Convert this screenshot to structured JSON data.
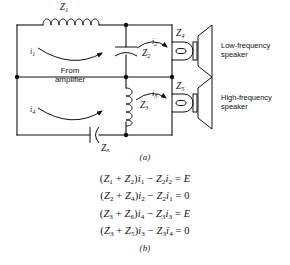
{
  "figure": {
    "panel_a_label": "(a)",
    "panel_b_label": "(b)",
    "source_text_line1": "From",
    "source_text_line2": "amplifier",
    "speaker_low_line1": "Low-frequency",
    "speaker_low_line2": "speaker",
    "speaker_high_line1": "High-frequency",
    "speaker_high_line2": "speaker"
  },
  "circuit": {
    "impedances": [
      {
        "id": "Z1",
        "base": "Z",
        "sub": "1",
        "component": "inductor",
        "position": "top-left-series"
      },
      {
        "id": "Z2",
        "base": "Z",
        "sub": "2",
        "component": "capacitor",
        "position": "upper-middle-shunt"
      },
      {
        "id": "Z3",
        "base": "Z",
        "sub": "3",
        "component": "inductor",
        "position": "lower-middle-shunt"
      },
      {
        "id": "Z4",
        "base": "Z",
        "sub": "4",
        "component": "coil-speaker",
        "position": "upper-right"
      },
      {
        "id": "Z5",
        "base": "Z",
        "sub": "5",
        "component": "coil-speaker",
        "position": "lower-right"
      },
      {
        "id": "Z6",
        "base": "Z",
        "sub": "6",
        "component": "capacitor",
        "position": "bottom-series"
      }
    ],
    "currents": [
      {
        "id": "i1",
        "base": "i",
        "sub": "1",
        "loop": "upper-left",
        "direction": "clockwise"
      },
      {
        "id": "i2",
        "base": "i",
        "sub": "2",
        "loop": "upper-right",
        "direction": "clockwise"
      },
      {
        "id": "i3",
        "base": "i",
        "sub": "3",
        "loop": "lower-right",
        "direction": "clockwise"
      },
      {
        "id": "i4",
        "base": "i",
        "sub": "4",
        "loop": "lower-left",
        "direction": "clockwise"
      }
    ]
  },
  "equations": [
    {
      "id": "eq1",
      "html": "(<span class=\"sym\">Z</span><sub>1</sub> + <span class=\"sym\">Z</span><sub>2</sub>)<span class=\"sym\">i</span><sub>1</sub> &minus; <span class=\"sym\">Z</span><sub>2</sub><span class=\"sym\">i</span><sub>2</sub> = <span class=\"sym\">E</span>",
      "plain": "(Z1 + Z2)i1 - Z2i2 = E"
    },
    {
      "id": "eq2",
      "html": "(<span class=\"sym\">Z</span><sub>2</sub> + <span class=\"sym\">Z</span><sub>4</sub>)<span class=\"sym\">i</span><sub>2</sub> &minus; <span class=\"sym\">Z</span><sub>2</sub><span class=\"sym\">i</span><sub>1</sub> = 0",
      "plain": "(Z2 + Z4)i2 - Z2i1 = 0"
    },
    {
      "id": "eq3",
      "html": "(<span class=\"sym\">Z</span><sub>3</sub> + <span class=\"sym\">Z</span><sub>6</sub>)<span class=\"sym\">i</span><sub>4</sub> &minus; <span class=\"sym\">Z</span><sub>3</sub><span class=\"sym\">i</span><sub>3</sub> = <span class=\"sym\">E</span>",
      "plain": "(Z3 + Z6)i4 - Z3i3 = E"
    },
    {
      "id": "eq4",
      "html": "(<span class=\"sym\">Z</span><sub>3</sub> + <span class=\"sym\">Z</span><sub>5</sub>)<span class=\"sym\">i</span><sub>3</sub> &minus; <span class=\"sym\">Z</span><sub>3</sub><span class=\"sym\">i</span><sub>4</sub> = 0",
      "plain": "(Z3 + Z5)i3 - Z3i4 = 0"
    }
  ],
  "colors": {
    "ink": "#111111",
    "paper": "#ffffff"
  }
}
